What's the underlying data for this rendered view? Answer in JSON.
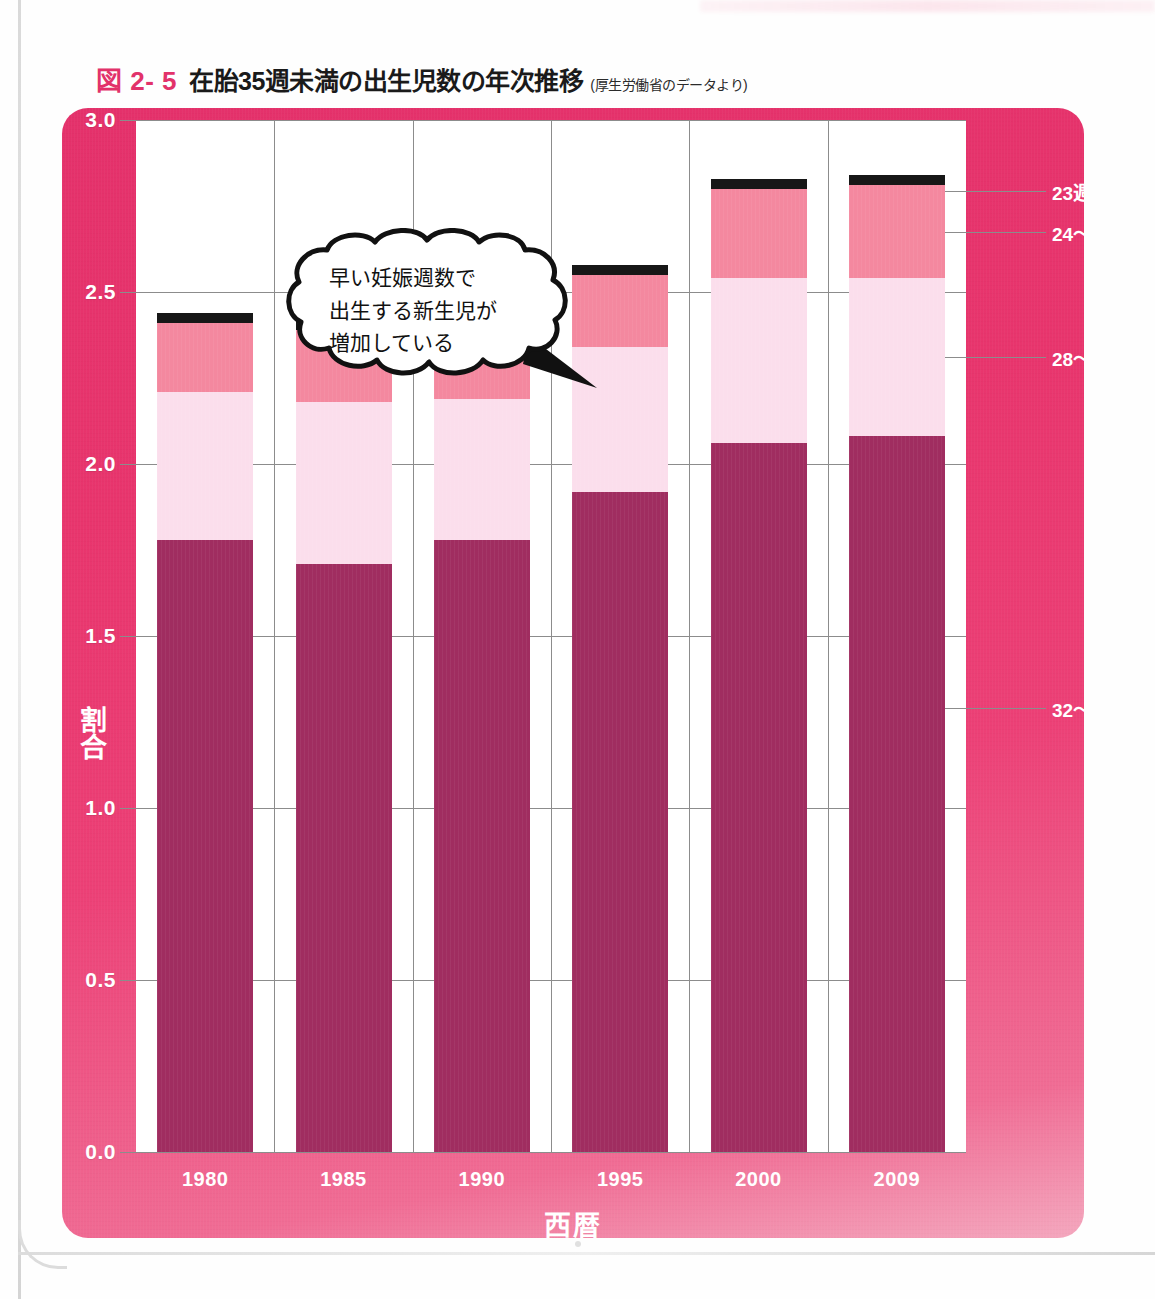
{
  "figure": {
    "number": "図 2- 5",
    "title": "在胎35週未満の出生児数の年次推移",
    "source": "(厚生労働省のデータより)"
  },
  "annotation": {
    "line1": "早い妊娠週数で",
    "line2": "出生する新生児が",
    "line3": "増加している"
  },
  "colors": {
    "panel_background": "#E8356D",
    "plot_background": "#FFFFFF",
    "grid": "#8C8C8C",
    "seg_23_or_less": "#171717",
    "seg_24_27": "#F4889F",
    "seg_28_31": "#FBDEEC",
    "seg_32_35": "#A02D60",
    "title_accent": "#E2326A",
    "axis_text": "#FFFFFF"
  },
  "chart_data": {
    "type": "bar",
    "title": "在胎35週未満の出生児数の年次推移",
    "subtitle": "(厚生労働省のデータより)",
    "stacked": true,
    "xlabel": "西暦",
    "ylabel": "割合",
    "categories": [
      "1980",
      "1985",
      "1990",
      "1995",
      "2000",
      "2009"
    ],
    "ylim": [
      0.0,
      3.0
    ],
    "ytick_labels": [
      "0.0",
      "0.5",
      "1.0",
      "1.5",
      "2.0",
      "2.5",
      "3.0"
    ],
    "ytick_values": [
      0.0,
      0.5,
      1.0,
      1.5,
      2.0,
      2.5,
      3.0
    ],
    "grid": true,
    "legend_position": "right",
    "series": [
      {
        "name": "32〜35週",
        "color": "#A02D60",
        "values": [
          1.78,
          1.71,
          1.78,
          1.92,
          2.06,
          2.08
        ]
      },
      {
        "name": "28〜31週",
        "color": "#FBDEEC",
        "values": [
          0.43,
          0.47,
          0.41,
          0.42,
          0.48,
          0.46
        ]
      },
      {
        "name": "24〜27週",
        "color": "#F4889F",
        "values": [
          0.2,
          0.21,
          0.23,
          0.21,
          0.26,
          0.27
        ]
      },
      {
        "name": "23週以下",
        "color": "#171717",
        "values": [
          0.03,
          0.03,
          0.03,
          0.03,
          0.03,
          0.03
        ]
      }
    ],
    "totals": [
      2.41,
      2.39,
      2.42,
      2.55,
      2.8,
      2.81
    ],
    "annotations": [
      "早い妊娠週数で出生する新生児が増加している"
    ]
  },
  "legend": [
    {
      "label": "23週以下",
      "color": "#171717"
    },
    {
      "label": "24〜27週",
      "color": "#F4889F"
    },
    {
      "label": "28〜31週",
      "color": "#FBDEEC"
    },
    {
      "label": "32〜35週",
      "color": "#A02D60"
    }
  ]
}
